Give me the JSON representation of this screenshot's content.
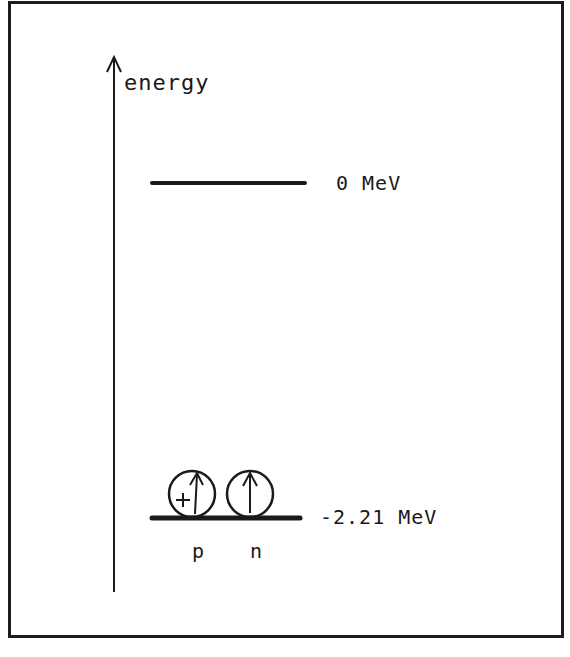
{
  "figure": {
    "axis": {
      "label": "energy",
      "direction": "up",
      "x": 114,
      "y_top": 56,
      "y_bottom": 592
    },
    "levels": [
      {
        "id": "unbound",
        "label": "0 MeV",
        "value_mev": 0,
        "y": 183,
        "x1": 152,
        "x2": 305
      },
      {
        "id": "bound",
        "label": "-2.21 MeV",
        "value_mev": -2.21,
        "y": 518,
        "x1": 152,
        "x2": 300
      }
    ],
    "particles": [
      {
        "id": "proton",
        "label": "p",
        "charge_symbol": "+",
        "spin": "up",
        "cx": 192,
        "cy": 494,
        "r": 24
      },
      {
        "id": "neutron",
        "label": "n",
        "charge_symbol": "",
        "spin": "up",
        "cx": 250,
        "cy": 494,
        "r": 24
      }
    ],
    "caption": {
      "visible": "partial",
      "text": ""
    },
    "colors": {
      "ink": "#1a1a1a",
      "background": "#ffffff",
      "frame": "#1c1c1c"
    }
  }
}
